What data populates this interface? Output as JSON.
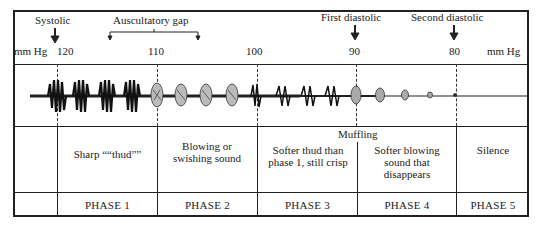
{
  "header": {
    "unit_left": "mm Hg",
    "unit_right": "mm Hg",
    "ticks": [
      "120",
      "110",
      "100",
      "90",
      "80"
    ],
    "markers": {
      "systolic": "Systolic",
      "auscultatory_gap": "Auscultatory gap",
      "first_diastolic": "First diastolic",
      "second_diastolic": "Second diastolic"
    }
  },
  "muffling_label": "Muffling",
  "descriptions": [
    "Sharp ““thud””",
    "Blowing or swishing sound",
    "Softer thud than phase 1, still crisp",
    "Softer blowing sound that disappears",
    "Silence"
  ],
  "phases": [
    "PHASE 1",
    "PHASE 2",
    "PHASE 3",
    "PHASE 4",
    "PHASE 5"
  ],
  "colors": {
    "line": "#222222",
    "background": "#ffffff"
  }
}
